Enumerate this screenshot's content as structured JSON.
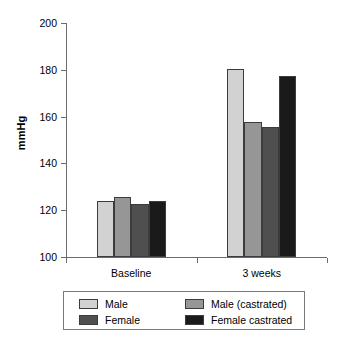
{
  "chart_data": {
    "type": "bar",
    "title": "",
    "subtitle": "",
    "xlabel": "",
    "ylabel": "mmHg",
    "categories": [
      "Baseline",
      "3 weeks"
    ],
    "ylim": [
      100,
      200
    ],
    "yticks": [
      100,
      120,
      140,
      160,
      180,
      200
    ],
    "ytick_labels": [
      "100",
      "120",
      "140",
      "160",
      "180",
      "200"
    ],
    "grid": false,
    "legend_position": "bottom",
    "series": [
      {
        "name": "Male",
        "color": "#d2d2d2",
        "values": [
          124,
          180.5
        ]
      },
      {
        "name": "Male (castrated)",
        "color": "#969696",
        "values": [
          125.5,
          157.5
        ]
      },
      {
        "name": "Female",
        "color": "#4f4f4f",
        "values": [
          122.5,
          155.5
        ]
      },
      {
        "name": "Female castrated",
        "color": "#1a1a1a",
        "values": [
          124,
          177.5
        ]
      }
    ]
  },
  "legend": {
    "entries": [
      {
        "label": "Male",
        "color": "#d2d2d2"
      },
      {
        "label": "Male (castrated)",
        "color": "#969696"
      },
      {
        "label": "Female",
        "color": "#4f4f4f"
      },
      {
        "label": "Female castrated",
        "color": "#1a1a1a"
      }
    ]
  },
  "colors": {
    "axis": "#6b6b6b",
    "bar_border": "#3c3c3c",
    "legend_border": "#7a7a7a",
    "text": "#000000",
    "background": "#ffffff"
  }
}
